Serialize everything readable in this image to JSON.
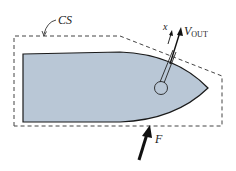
{
  "diagram": {
    "type": "control-volume sketch",
    "labels": {
      "control_surface": "CS",
      "axis": "x",
      "velocity_main": "V",
      "velocity_sub": "OUT",
      "force": "F"
    },
    "colors": {
      "hull_fill": "#b9c7d6",
      "hull_stroke": "#1a1a1a",
      "dash_stroke": "#444444",
      "arrow": "#111111"
    }
  }
}
